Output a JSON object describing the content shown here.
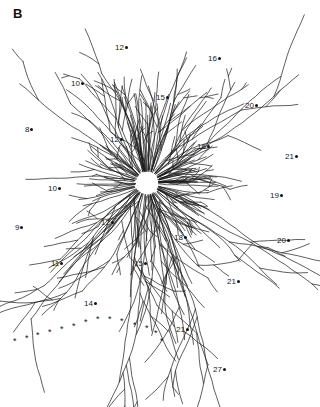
{
  "figure": {
    "panel_letter": "B",
    "soma_center": [
      147,
      183
    ],
    "ink_color": "#111111",
    "background_color": "#ffffff",
    "site_labels": [
      {
        "text": "12",
        "x": 115,
        "y": 44
      },
      {
        "text": "16",
        "x": 208,
        "y": 55
      },
      {
        "text": "10",
        "x": 71,
        "y": 80
      },
      {
        "text": "15",
        "x": 156,
        "y": 94
      },
      {
        "text": "20",
        "x": 245,
        "y": 102
      },
      {
        "text": "8",
        "x": 25,
        "y": 126
      },
      {
        "text": "12",
        "x": 110,
        "y": 136
      },
      {
        "text": "16",
        "x": 197,
        "y": 143
      },
      {
        "text": "21",
        "x": 285,
        "y": 153
      },
      {
        "text": "10",
        "x": 48,
        "y": 185
      },
      {
        "text": "19",
        "x": 270,
        "y": 192
      },
      {
        "text": "12",
        "x": 101,
        "y": 219
      },
      {
        "text": "9",
        "x": 15,
        "y": 224
      },
      {
        "text": "18",
        "x": 174,
        "y": 234
      },
      {
        "text": "20",
        "x": 277,
        "y": 237
      },
      {
        "text": "11",
        "x": 51,
        "y": 260
      },
      {
        "text": "15",
        "x": 134,
        "y": 260
      },
      {
        "text": "21",
        "x": 227,
        "y": 278
      },
      {
        "text": "14",
        "x": 84,
        "y": 300
      },
      {
        "text": "21",
        "x": 176,
        "y": 326
      },
      {
        "text": "27",
        "x": 213,
        "y": 366
      }
    ],
    "asterisk_symbol": "*",
    "asterisks": [
      [
        16,
        340
      ],
      [
        28,
        337
      ],
      [
        39,
        334
      ],
      [
        51,
        331
      ],
      [
        63,
        328
      ],
      [
        75,
        325
      ],
      [
        87,
        321
      ],
      [
        99,
        318
      ],
      [
        111,
        318
      ],
      [
        123,
        320
      ],
      [
        136,
        324
      ],
      [
        148,
        327
      ],
      [
        157,
        332
      ],
      [
        163,
        340
      ]
    ]
  }
}
